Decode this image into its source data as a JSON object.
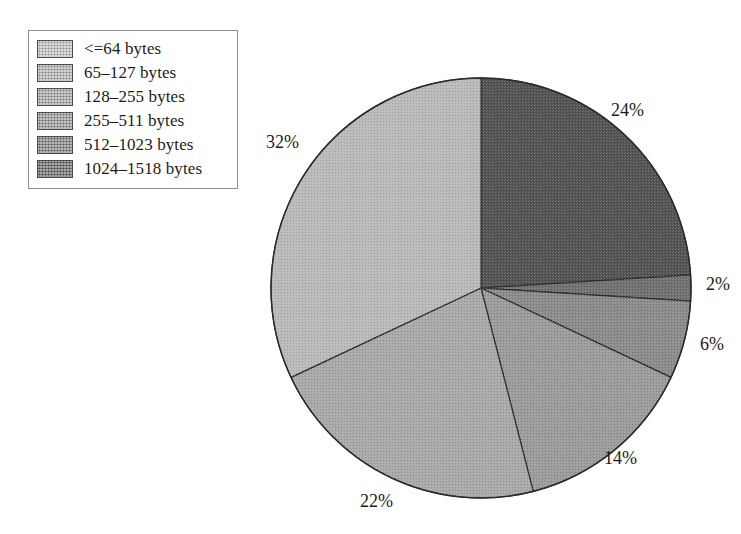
{
  "figure": {
    "background_color": "#ffffff",
    "text_color": "#1c1c1c"
  },
  "legend": {
    "border_color": "#8e8e8e",
    "background_color": "#ffffff",
    "items": [
      {
        "label": "<=64 bytes",
        "color": "#b9b9b9"
      },
      {
        "label": "65–127 bytes",
        "color": "#a8a8a8"
      },
      {
        "label": "128–255 bytes",
        "color": "#9a9a9a"
      },
      {
        "label": "255–511 bytes",
        "color": "#8a8a8a"
      },
      {
        "label": "512–1023 bytes",
        "color": "#6f6f6f"
      },
      {
        "label": "1024–1518 bytes",
        "color": "#525252"
      }
    ]
  },
  "chart_data": {
    "type": "pie",
    "title": "",
    "xlabel": "",
    "ylabel": "",
    "legend_position": "top-left",
    "grid": false,
    "start_angle_deg": 0,
    "direction": "clockwise",
    "center": {
      "x": 481,
      "y": 288
    },
    "radius": 210,
    "categories": [
      "1024–1518 bytes",
      "512–1023 bytes",
      "255–511 bytes",
      "128–255 bytes",
      "65–127 bytes",
      "<=64 bytes"
    ],
    "values": [
      24,
      2,
      6,
      14,
      22,
      32
    ],
    "value_labels": [
      "24%",
      "2%",
      "6%",
      "14%",
      "22%",
      "32%"
    ],
    "colors": [
      "#525252",
      "#6f6f6f",
      "#8a8a8a",
      "#9a9a9a",
      "#a8a8a8",
      "#b9b9b9"
    ],
    "slices": [
      {
        "category": "1024–1518 bytes",
        "value": 24,
        "label": "24%",
        "color": "#525252",
        "start_deg": 0,
        "end_deg": 86.4,
        "label_x": 611,
        "label_y": 100
      },
      {
        "category": "512–1023 bytes",
        "value": 2,
        "label": "2%",
        "color": "#6f6f6f",
        "start_deg": 86.4,
        "end_deg": 93.6,
        "label_x": 706,
        "label_y": 274
      },
      {
        "category": "255–511 bytes",
        "value": 6,
        "label": "6%",
        "color": "#8a8a8a",
        "start_deg": 93.6,
        "end_deg": 115.2,
        "label_x": 700,
        "label_y": 334
      },
      {
        "category": "128–255 bytes",
        "value": 14,
        "label": "14%",
        "color": "#9a9a9a",
        "start_deg": 115.2,
        "end_deg": 165.6,
        "label_x": 604,
        "label_y": 448
      },
      {
        "category": "65–127 bytes",
        "value": 22,
        "label": "22%",
        "color": "#a8a8a8",
        "start_deg": 165.6,
        "end_deg": 244.8,
        "label_x": 360,
        "label_y": 491
      },
      {
        "category": "<=64 bytes",
        "value": 32,
        "label": "32%",
        "color": "#b9b9b9",
        "start_deg": 244.8,
        "end_deg": 360,
        "label_x": 266,
        "label_y": 132
      }
    ],
    "slice_border_color": "#2a2a2a"
  }
}
